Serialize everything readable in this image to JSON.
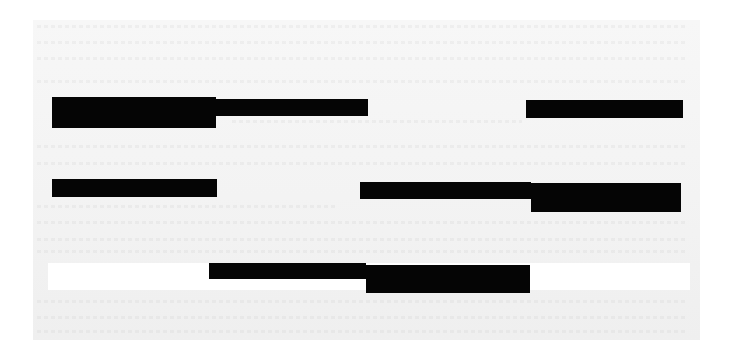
{
  "document": {
    "type": "redacted-scan",
    "page": {
      "x": 33,
      "y": 20,
      "width": 667,
      "height": 320,
      "color": "#f3f3f3"
    },
    "white_band": {
      "x": 48,
      "y": 263,
      "width": 642,
      "height": 27,
      "color": "#ffffff"
    },
    "redaction_color": "#050505",
    "redactions": [
      {
        "id": "redaction-1a",
        "x": 52,
        "y": 97,
        "width": 164,
        "height": 31
      },
      {
        "id": "redaction-1b",
        "x": 216,
        "y": 99,
        "width": 152,
        "height": 17
      },
      {
        "id": "redaction-2",
        "x": 526,
        "y": 100,
        "width": 157,
        "height": 18
      },
      {
        "id": "redaction-3",
        "x": 52,
        "y": 179,
        "width": 165,
        "height": 18
      },
      {
        "id": "redaction-4a",
        "x": 360,
        "y": 182,
        "width": 171,
        "height": 17
      },
      {
        "id": "redaction-4b",
        "x": 531,
        "y": 183,
        "width": 150,
        "height": 29
      },
      {
        "id": "redaction-5a",
        "x": 209,
        "y": 263,
        "width": 157,
        "height": 16
      },
      {
        "id": "redaction-5b",
        "x": 366,
        "y": 265,
        "width": 164,
        "height": 28
      }
    ],
    "faint_text_lines": [
      {
        "x": 37,
        "y": 25,
        "width": 650
      },
      {
        "x": 37,
        "y": 41,
        "width": 650
      },
      {
        "x": 37,
        "y": 57,
        "width": 650
      },
      {
        "x": 37,
        "y": 80,
        "width": 650
      },
      {
        "x": 232,
        "y": 120,
        "width": 290
      },
      {
        "x": 37,
        "y": 145,
        "width": 650
      },
      {
        "x": 37,
        "y": 162,
        "width": 650
      },
      {
        "x": 37,
        "y": 205,
        "width": 300
      },
      {
        "x": 37,
        "y": 221,
        "width": 650
      },
      {
        "x": 37,
        "y": 238,
        "width": 650
      },
      {
        "x": 37,
        "y": 250,
        "width": 650
      },
      {
        "x": 37,
        "y": 300,
        "width": 650
      },
      {
        "x": 37,
        "y": 316,
        "width": 650
      },
      {
        "x": 37,
        "y": 330,
        "width": 650
      }
    ]
  }
}
